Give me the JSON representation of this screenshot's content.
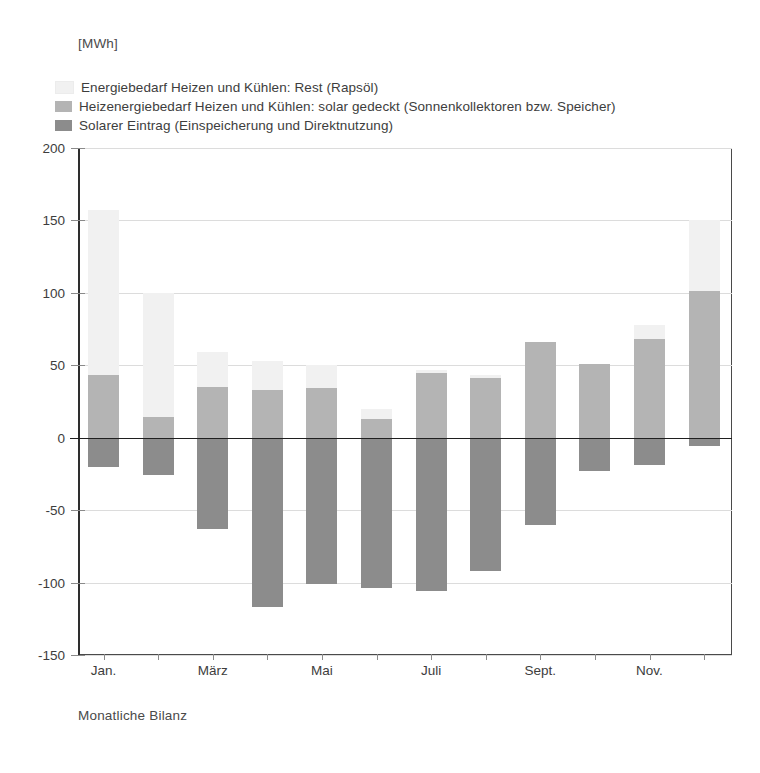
{
  "unit_label": "[MWh]",
  "caption": "Monatliche Bilanz",
  "colors": {
    "rest": "#f1f1f1",
    "solar_covered": "#b4b4b4",
    "solar_input": "#8c8c8c",
    "axis": "#2e2e2e",
    "grid": "#dcdcdc",
    "text": "#3d3d3d"
  },
  "legend": [
    {
      "label": "Energiebedarf Heizen und Kühlen: Rest (Rapsöl)",
      "color": "#f1f1f1"
    },
    {
      "label": "Heizenergiebedarf Heizen und Kühlen: solar gedeckt (Sonnenkollektoren bzw. Speicher)",
      "color": "#b4b4b4"
    },
    {
      "label": "Solarer Eintrag (Einspeicherung und Direktnutzung)",
      "color": "#8c8c8c"
    }
  ],
  "axis": {
    "y_ticks": [
      200,
      150,
      100,
      50,
      0,
      -50,
      -100,
      -150
    ],
    "y_tick_labels": [
      "200",
      "150",
      "100",
      "50",
      "0",
      "-50",
      "-100",
      "-150"
    ],
    "ylim": [
      -150,
      200
    ],
    "x_tick_labels": [
      "Jan.",
      "März",
      "Mai",
      "Juli",
      "Sept.",
      "Nov."
    ],
    "x_tick_label_indices": [
      0,
      2,
      4,
      6,
      8,
      10
    ]
  },
  "chart_data": {
    "type": "bar",
    "title": "",
    "subtitle": "",
    "xlabel": "Monatliche Bilanz",
    "ylabel": "[MWh]",
    "ylim": [
      -150,
      200
    ],
    "grid": true,
    "legend_position": "top-left",
    "stacked": true,
    "categories": [
      "Jan.",
      "Feb.",
      "März",
      "April",
      "Mai",
      "Juni",
      "Juli",
      "Aug.",
      "Sept.",
      "Okt.",
      "Nov.",
      "Dez."
    ],
    "series": [
      {
        "name": "Energiebedarf Heizen und Kühlen: Rest (Rapsöl)",
        "color": "#f1f1f1",
        "values": [
          114,
          86,
          24,
          20,
          16,
          7,
          2,
          2,
          0,
          0,
          10,
          49
        ]
      },
      {
        "name": "Heizenergiebedarf Heizen und Kühlen: solar gedeckt (Sonnenkollektoren bzw. Speicher)",
        "color": "#b4b4b4",
        "values": [
          43,
          14,
          35,
          33,
          34,
          13,
          45,
          41,
          66,
          51,
          68,
          101
        ]
      },
      {
        "name": "Solarer Eintrag (Einspeicherung und Direktnutzung)",
        "color": "#8c8c8c",
        "values": [
          -20,
          -26,
          -63,
          -117,
          -101,
          -104,
          -106,
          -92,
          -60,
          -23,
          -19,
          -6
        ]
      }
    ],
    "stack_tops": [
      157,
      100,
      59,
      53,
      50,
      20,
      47,
      43,
      66,
      51,
      78,
      150
    ]
  }
}
